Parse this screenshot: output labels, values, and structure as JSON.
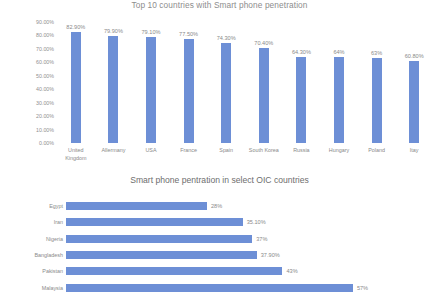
{
  "chart_data": [
    {
      "type": "bar",
      "orientation": "vertical",
      "title": "Top 10 countries with Smart phone penetration",
      "xlabel": "",
      "ylabel": "",
      "categories": [
        "United Kingdom",
        "Allermany",
        "USA",
        "France",
        "Spain",
        "South Korea",
        "Russia",
        "Hungary",
        "Poland",
        "Itay"
      ],
      "values": [
        82.9,
        79.9,
        79.1,
        77.5,
        74.3,
        70.4,
        64.3,
        64,
        63,
        60.8
      ],
      "data_labels": [
        "82.90%",
        "79.90%",
        "79.10%",
        "77.50%",
        "74.30%",
        "70.40%",
        "64.30%",
        "64%",
        "63%",
        "60.80%"
      ],
      "ylim": [
        0,
        90
      ],
      "yticks": [
        0,
        10,
        20,
        30,
        40,
        50,
        60,
        70,
        80,
        90
      ],
      "ytick_labels": [
        "0.00%",
        "10.00%",
        "20.00%",
        "30.00%",
        "40.00%",
        "50.00%",
        "60.00%",
        "70.00%",
        "80.00%",
        "90.00%"
      ],
      "grid": false,
      "legend": false,
      "series_color": "#6d8fd6"
    },
    {
      "type": "bar",
      "orientation": "horizontal",
      "title": "Smart phone pentration in select OIC countries",
      "xlabel": "",
      "ylabel": "",
      "categories": [
        "Egypt",
        "Iran",
        "Nigeria",
        "Bangladesh",
        "Pakistan",
        "Malaysia"
      ],
      "values": [
        28,
        35.1,
        37,
        37.9,
        43,
        57
      ],
      "data_labels": [
        "28%",
        "35.10%",
        "37%",
        "37.90%",
        "43%",
        "57%"
      ],
      "xlim": [
        0,
        60
      ],
      "grid": false,
      "legend": false,
      "series_color": "#6d8fd6"
    }
  ]
}
